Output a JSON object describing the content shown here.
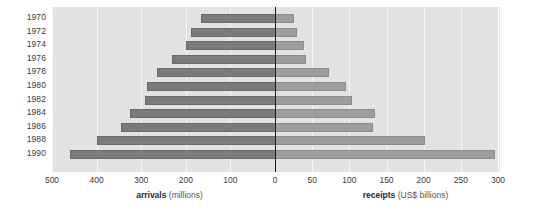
{
  "chart_data": {
    "type": "bar",
    "orientation": "horizontal-diverging",
    "title": "",
    "subtitle": "",
    "categories": [
      "1970",
      "1972",
      "1974",
      "1976",
      "1978",
      "1980",
      "1982",
      "1984",
      "1986",
      "1988",
      "1990"
    ],
    "series": [
      {
        "name": "arrivals",
        "units": "millions",
        "side": "left",
        "color": "#7b7b7b",
        "values": [
          165,
          188,
          200,
          230,
          265,
          287,
          292,
          325,
          345,
          400,
          460
        ]
      },
      {
        "name": "receipts",
        "units": "US$ billions",
        "side": "right",
        "color": "#9d9d9d",
        "values": [
          25,
          29,
          39,
          42,
          73,
          96,
          104,
          135,
          132,
          202,
          296
        ]
      }
    ],
    "left_axis": {
      "label_bold": "arrivals",
      "label_paren": "(millions)",
      "ticks": [
        500,
        400,
        300,
        200,
        100,
        0
      ],
      "tick_labels": [
        "500",
        "400",
        "300",
        "200",
        "100",
        "0"
      ],
      "max": 500,
      "min": 0,
      "direction": "reversed"
    },
    "right_axis": {
      "label_bold": "receipts",
      "label_paren": "(US$ billions)",
      "ticks": [
        0,
        50,
        100,
        150,
        200,
        250,
        300
      ],
      "tick_labels": [
        "0",
        "50",
        "100",
        "150",
        "200",
        "250",
        "300"
      ],
      "max": 300,
      "min": 0
    },
    "grid": true,
    "gridline_color": "#f6f6f6",
    "plot_background": "#e2e2e2",
    "zero_line_color": "#1a1a1a",
    "legend": "none",
    "xlabel": "",
    "ylabel": ""
  }
}
